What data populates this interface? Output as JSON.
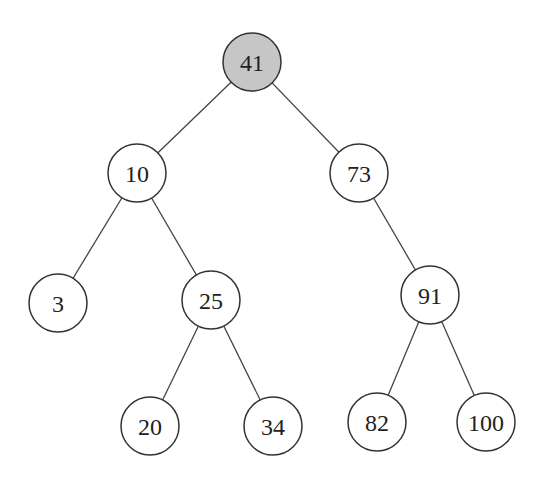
{
  "tree": {
    "type": "binary-search-tree",
    "root_fill": "#c6c6c6",
    "node_fill": "#ffffff",
    "stroke": "#333333",
    "radius": 29,
    "nodes": [
      {
        "id": "n41",
        "value": "41",
        "x": 252,
        "y": 62,
        "highlighted": true
      },
      {
        "id": "n10",
        "value": "10",
        "x": 137,
        "y": 173
      },
      {
        "id": "n73",
        "value": "73",
        "x": 359,
        "y": 173
      },
      {
        "id": "n3",
        "value": "3",
        "x": 58,
        "y": 303
      },
      {
        "id": "n25",
        "value": "25",
        "x": 211,
        "y": 300
      },
      {
        "id": "n91",
        "value": "91",
        "x": 430,
        "y": 295
      },
      {
        "id": "n20",
        "value": "20",
        "x": 150,
        "y": 426
      },
      {
        "id": "n34",
        "value": "34",
        "x": 273,
        "y": 426
      },
      {
        "id": "n82",
        "value": "82",
        "x": 377,
        "y": 422
      },
      {
        "id": "n100",
        "value": "100",
        "x": 486,
        "y": 422
      }
    ],
    "edges": [
      {
        "from": "n41",
        "to": "n10"
      },
      {
        "from": "n41",
        "to": "n73"
      },
      {
        "from": "n10",
        "to": "n3"
      },
      {
        "from": "n10",
        "to": "n25"
      },
      {
        "from": "n73",
        "to": "n91"
      },
      {
        "from": "n25",
        "to": "n20"
      },
      {
        "from": "n25",
        "to": "n34"
      },
      {
        "from": "n91",
        "to": "n82"
      },
      {
        "from": "n91",
        "to": "n100"
      }
    ]
  }
}
